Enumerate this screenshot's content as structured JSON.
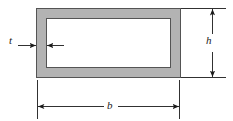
{
  "figure": {
    "name": "hollow-rectangular-tube-cross-section",
    "background_color": "#ffffff",
    "line_color": "#1a1a1a",
    "wall_fill_color": "#b3b3b3",
    "wall_outline_color": "#4d4d4d",
    "interior_fill_color": "#ffffff"
  },
  "labels": {
    "thickness": "t",
    "height": "h",
    "width": "b"
  },
  "geometry": {
    "outer_left": 36,
    "outer_top": 8,
    "outer_right": 181,
    "outer_bottom": 78,
    "wall_thickness": 10,
    "inner_left": 46,
    "inner_top": 18,
    "inner_right": 171,
    "inner_bottom": 68
  },
  "dimensions": {
    "height_dim": {
      "label": "h",
      "axis": "vertical",
      "line_x": 212,
      "from_y": 8,
      "to_y": 78,
      "extension_top_y": 8,
      "extension_bottom_y": 78,
      "extension_right_x": 226
    },
    "width_dim": {
      "label": "b",
      "axis": "horizontal",
      "line_y": 106,
      "from_x": 37,
      "to_x": 180,
      "extension_left_x": 37,
      "extension_right_x": 180,
      "extension_bottom_y": 119
    },
    "thickness_dim": {
      "label": "t",
      "axis": "horizontal",
      "line_y": 45,
      "left_arrow_from_x": 18,
      "left_arrow_to_x": 36,
      "right_arrow_from_x": 64,
      "right_arrow_to_x": 47
    }
  }
}
